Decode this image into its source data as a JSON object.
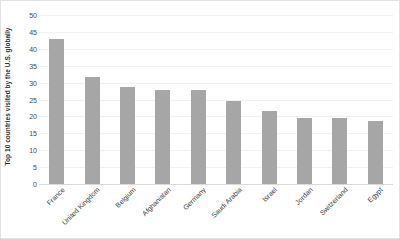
{
  "chart_data": {
    "type": "bar",
    "title": "",
    "xlabel": "",
    "ylabel": "Top 10 countries visited by the U.S. globally",
    "ylim": [
      0,
      50
    ],
    "yticks": [
      0,
      5,
      10,
      15,
      20,
      25,
      30,
      35,
      40,
      45,
      50
    ],
    "grid": true,
    "legend": false,
    "bar_color": "#a6a6a6",
    "gridline_color": "#f1f1f1",
    "categories": [
      "France",
      "United Kingdom",
      "Belgium",
      "Afghanistan",
      "Germany",
      "Saudi Arabia",
      "Israel",
      "Jordan",
      "Switzerland",
      "Egypt"
    ],
    "values": [
      43.0,
      31.8,
      28.8,
      27.8,
      27.7,
      24.7,
      21.6,
      19.6,
      19.6,
      18.5
    ]
  }
}
